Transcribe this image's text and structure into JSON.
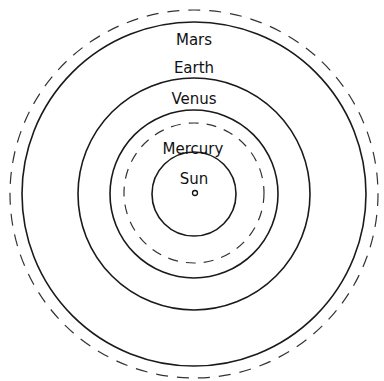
{
  "diagram": {
    "type": "orbit-diagram",
    "center": {
      "x": 194,
      "y": 194
    },
    "sun": {
      "label": "Sun",
      "radius": 42,
      "dot_radius": 2.5
    },
    "orbits": [
      {
        "name": "Mercury",
        "label": "Mercury",
        "radius": 70,
        "style": "dashed",
        "label_y": 148
      },
      {
        "name": "Venus",
        "label": "Venus",
        "radius": 84,
        "style": "solid",
        "label_y": 98
      },
      {
        "name": "Earth",
        "label": "Earth",
        "radius": 116,
        "style": "solid",
        "label_y": 68
      },
      {
        "name": "Mars",
        "label": "Mars",
        "radius": 172,
        "style": "solid",
        "label_y": 40
      },
      {
        "name": "Mars-outer",
        "label": "",
        "radius": 184,
        "style": "dashed"
      }
    ],
    "colors": {
      "line": "#1a1a1a",
      "background": "#ffffff"
    }
  }
}
